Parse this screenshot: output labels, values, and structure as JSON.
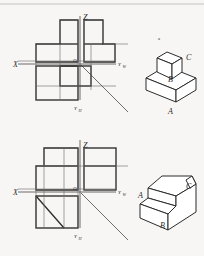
{
  "page": {
    "background_color": "#f7f6f4",
    "line_color": "#2b2b2b",
    "thin_line_color": "#6a6a6a",
    "width": 204,
    "height": 256
  },
  "figures": [
    {
      "id": "figure-top",
      "axis_labels": {
        "x": "X",
        "z": "Z",
        "y_w": "Y",
        "y_w_sub": "W",
        "y_h": "Y",
        "y_h_sub": "H",
        "origin": "O"
      },
      "solid": {
        "name": "stepped-block-two-tier",
        "face_labels": [
          "A",
          "B",
          "C"
        ],
        "marker": "a"
      }
    },
    {
      "id": "figure-bottom",
      "axis_labels": {
        "x": "X",
        "z": "Z",
        "y_w": "Y",
        "y_w_sub": "W",
        "y_h": "Y",
        "y_h_sub": "H",
        "origin": "O"
      },
      "solid": {
        "name": "stepped-block-with-slant",
        "face_labels": [
          "A",
          "B",
          "C"
        ]
      }
    }
  ]
}
